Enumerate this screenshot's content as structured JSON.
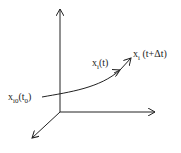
{
  "diagram": {
    "labels": {
      "start": {
        "base": "x",
        "sub": "i0",
        "arg_open": "(t",
        "arg_sub": "0",
        "arg_close": ")"
      },
      "mid": {
        "base": "x",
        "sub": "i",
        "arg": "(t)"
      },
      "end": {
        "base": "x",
        "sub": "i",
        "arg": " (t+Δt)"
      }
    },
    "axes": [
      "vertical-axis",
      "horizontal-axis",
      "depth-axis"
    ],
    "colors": {
      "stroke": "#222222",
      "background": "#ffffff"
    }
  }
}
